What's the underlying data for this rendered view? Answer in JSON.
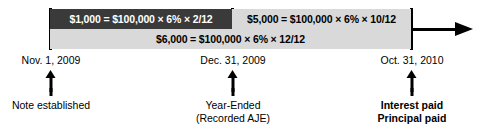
{
  "diagram": {
    "axis": {
      "arrow_direction": "right",
      "start_x": 50,
      "end_x": 463
    },
    "bars": [
      {
        "id": "accrued-interest-2009",
        "label": "$1,000 = $100,000 × 6% × 2/12",
        "amount": "$1,000",
        "principal": "$100,000",
        "rate": "6%",
        "fraction": "2/12",
        "style": "dark",
        "bg_color": "#3a3a3a",
        "text_color": "#ffffff",
        "span": "Nov. 1, 2009 – Dec. 31, 2009"
      },
      {
        "id": "interest-2010",
        "label": "$5,000 = $100,000 × 6% × 10/12",
        "amount": "$5,000",
        "principal": "$100,000",
        "rate": "6%",
        "fraction": "10/12",
        "style": "light",
        "bg_color": "#d9d9d9",
        "text_color": "#000000",
        "span": "Dec. 31, 2009 – Oct. 31, 2010"
      },
      {
        "id": "total-interest",
        "label": "$6,000 = $100,000 × 6% × 12/12",
        "amount": "$6,000",
        "principal": "$100,000",
        "rate": "6%",
        "fraction": "12/12",
        "style": "light",
        "bg_color": "#d9d9d9",
        "text_color": "#000000",
        "span": "Nov. 1, 2009 – Oct. 31, 2010"
      }
    ],
    "milestones": [
      {
        "id": "note-established",
        "date": "Nov. 1, 2009",
        "caption_lines": [
          "Note established"
        ],
        "bold": false,
        "x": 51
      },
      {
        "id": "year-ended",
        "date": "Dec. 31, 2009",
        "caption_lines": [
          "Year-Ended",
          "(Recorded AJE)"
        ],
        "bold": false,
        "x": 233
      },
      {
        "id": "maturity",
        "date": "Oct. 31, 2010",
        "caption_lines": [
          "Interest paid",
          "Principal paid"
        ],
        "bold": true,
        "x": 412
      }
    ]
  }
}
